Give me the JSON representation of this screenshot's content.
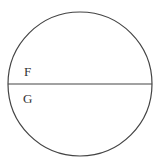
{
  "diagram": {
    "shape": "circle",
    "regions": [
      {
        "label": "F",
        "position": "upper"
      },
      {
        "label": "G",
        "position": "lower"
      }
    ],
    "stroke_color": "#444444",
    "background": "#ffffff"
  }
}
